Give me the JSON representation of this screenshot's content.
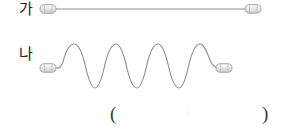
{
  "figure": {
    "title": "",
    "background_color": "#ffffff",
    "line_color": "#8a8a8a",
    "connector_body_color": "#e8e8e8",
    "connector_stroke_color": "#9a9a9a",
    "text_color": "#1d1d1d",
    "rows": [
      {
        "id": "row-ga",
        "label": "가",
        "wave_type": "straight",
        "description": "straight taut string between two clamps",
        "crests": 0,
        "troughs": 0,
        "amplitude": 0,
        "baseline_y": 9,
        "left_connector_x": 41,
        "right_connector_x": 246,
        "left_connector_y": 9,
        "right_connector_y": 9
      },
      {
        "id": "row-na",
        "label": "나",
        "wave_type": "sine",
        "description": "standing wave with five crests and four troughs between two clamps",
        "crests": 5,
        "troughs": 4,
        "amplitude": 22,
        "baseline_y": 68,
        "left_connector_x": 41,
        "right_connector_x": 217,
        "left_connector_y": 68,
        "right_connector_y": 68,
        "wave_start_x": 60,
        "wave_end_x": 222
      }
    ],
    "answer_blank": {
      "open_paren": "(",
      "close_paren": ")",
      "value": ""
    }
  }
}
